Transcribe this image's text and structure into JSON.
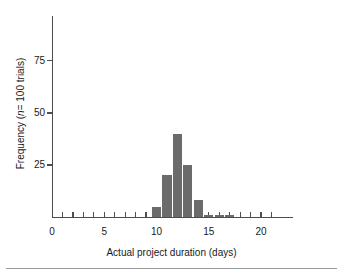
{
  "chart_data": {
    "type": "bar",
    "title": "",
    "subtitle": "",
    "xlabel": "Actual project duration (days)",
    "ylabel": "Frequency (n= 100 trials)",
    "ylabel_prefix": "Frequency (",
    "ylabel_italic": "n",
    "ylabel_suffix": "= 100 trials)",
    "xlim": [
      0,
      23
    ],
    "ylim": [
      0,
      85
    ],
    "grid": false,
    "legend": null,
    "x_tick_labels": [
      "0",
      "5",
      "10",
      "15",
      "20"
    ],
    "x_tick_label_values": [
      0,
      5,
      10,
      15,
      20
    ],
    "x_minor_ticks": [
      1,
      2,
      3,
      4,
      5,
      6,
      7,
      8,
      9,
      10,
      11,
      12,
      13,
      14,
      15,
      16,
      17,
      18,
      19,
      20,
      21
    ],
    "y_tick_labels": [
      "25",
      "50",
      "75"
    ],
    "y_tick_label_values": [
      25,
      50,
      75
    ],
    "bar_color": "#6b6b6b",
    "axis_color": "#4d4d4d",
    "background": "#ffffff",
    "categories": [
      10,
      11,
      12,
      13,
      14,
      15,
      16,
      17
    ],
    "values": [
      5,
      20,
      40,
      25,
      8,
      1,
      1,
      1
    ],
    "bars": [
      {
        "x": 10,
        "y": 5
      },
      {
        "x": 11,
        "y": 20
      },
      {
        "x": 12,
        "y": 40
      },
      {
        "x": 13,
        "y": 25
      },
      {
        "x": 14,
        "y": 8
      },
      {
        "x": 15,
        "y": 1
      },
      {
        "x": 16,
        "y": 1
      },
      {
        "x": 17,
        "y": 1
      }
    ]
  }
}
